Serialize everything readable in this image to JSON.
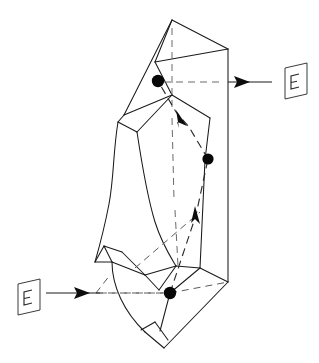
{
  "figure": {
    "background_color": "#ffffff",
    "line_color": "#1a1a1a",
    "hidden_line_color": "#5a5a5a",
    "marker_color": "#080808",
    "width": 319,
    "height": 363
  },
  "labels": {
    "plane_symbol_top_right": "E",
    "plane_symbol_bottom_left": "E"
  },
  "annotations": {
    "top_right_pointer": "arrow-from-E-plane-top-right",
    "bottom_left_pointer": "arrow-from-E-plane-bottom-left",
    "path_arrow_upper": "arrowhead-up-left",
    "path_arrow_lower": "arrowhead-up"
  },
  "markers": [
    {
      "name": "marker-point-top",
      "x": 158,
      "y": 81,
      "radius": 6.2
    },
    {
      "name": "marker-point-middle",
      "x": 208,
      "y": 159,
      "radius": 5.6
    },
    {
      "name": "marker-point-bottom",
      "x": 170,
      "y": 293,
      "radius": 6.2
    }
  ],
  "geometry": {
    "apex": {
      "x": 172,
      "y": 20
    },
    "right_vertical_edge": {
      "x": 228,
      "y_top": 49,
      "y_bottom": 282
    },
    "bottom_tip": {
      "x": 164,
      "y": 348
    }
  },
  "chart_data": {
    "type": "diagram",
    "markers": [
      {
        "label": "top marker",
        "x": 158,
        "y": 81
      },
      {
        "label": "middle marker",
        "x": 208,
        "y": 159
      },
      {
        "label": "bottom marker",
        "x": 170,
        "y": 293
      }
    ],
    "dashed_path": [
      {
        "x": 170,
        "y": 293
      },
      {
        "x": 196,
        "y": 215
      },
      {
        "x": 208,
        "y": 159
      },
      {
        "x": 189,
        "y": 127
      },
      {
        "x": 176,
        "y": 112
      },
      {
        "x": 158,
        "y": 81
      }
    ],
    "arrow_positions": [
      {
        "label": "upper arrowhead",
        "x": 178,
        "y": 115,
        "direction": "up-left"
      },
      {
        "label": "lower arrowhead",
        "x": 195,
        "y": 211,
        "direction": "up"
      }
    ],
    "pointer_arrows": [
      {
        "label": "E",
        "from_x": 272,
        "from_y": 82,
        "to_x": 222,
        "to_y": 82,
        "direction": "left-to-right-into-crystal",
        "position": "top-right"
      },
      {
        "label": "E",
        "from_x": 46,
        "from_y": 293,
        "to_x": 96,
        "to_y": 293,
        "direction": "left-to-right-into-crystal",
        "position": "bottom-left"
      }
    ],
    "legend": [],
    "grid": false
  }
}
